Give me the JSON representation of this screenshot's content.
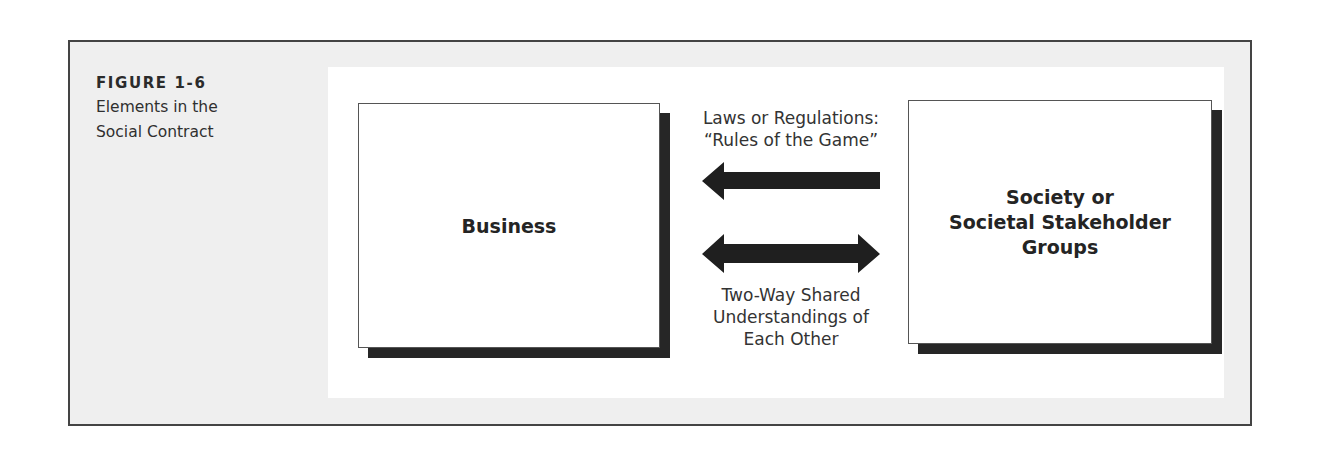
{
  "figure": {
    "number": "FIGURE 1-6",
    "title_line1": "Elements in the",
    "title_line2": "Social Contract"
  },
  "diagram": {
    "nodes": {
      "business": "Business",
      "society_line1": "Society or",
      "society_line2": "Societal Stakeholder",
      "society_line3": "Groups"
    },
    "edges": {
      "laws": {
        "direction": "society-to-business",
        "label_line1": "Laws or Regulations:",
        "label_line2": "“Rules of the Game”"
      },
      "shared": {
        "direction": "bidirectional",
        "label_line1": "Two-Way Shared",
        "label_line2": "Understandings of",
        "label_line3": "Each Other"
      }
    }
  },
  "colors": {
    "frame_bg": "#efefef",
    "frame_border": "#444444",
    "shadow": "#262626",
    "arrow": "#1f1f1f"
  }
}
